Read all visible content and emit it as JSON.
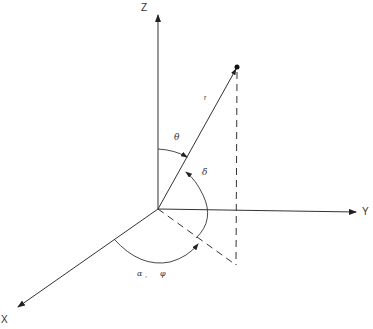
{
  "diagram": {
    "type": "3d-spherical-coordinate-system",
    "axes": {
      "z": {
        "label": "Z"
      },
      "y": {
        "label": "Y"
      },
      "x": {
        "label": "X"
      }
    },
    "vector": {
      "label": "r"
    },
    "angles": {
      "theta": {
        "label": "θ"
      },
      "delta": {
        "label": "δ"
      },
      "alpha_phi": {
        "label_alpha": "α",
        "separator": ",",
        "label_phi": "φ"
      }
    },
    "colors": {
      "stroke": "#333333",
      "background": "#ffffff"
    }
  }
}
